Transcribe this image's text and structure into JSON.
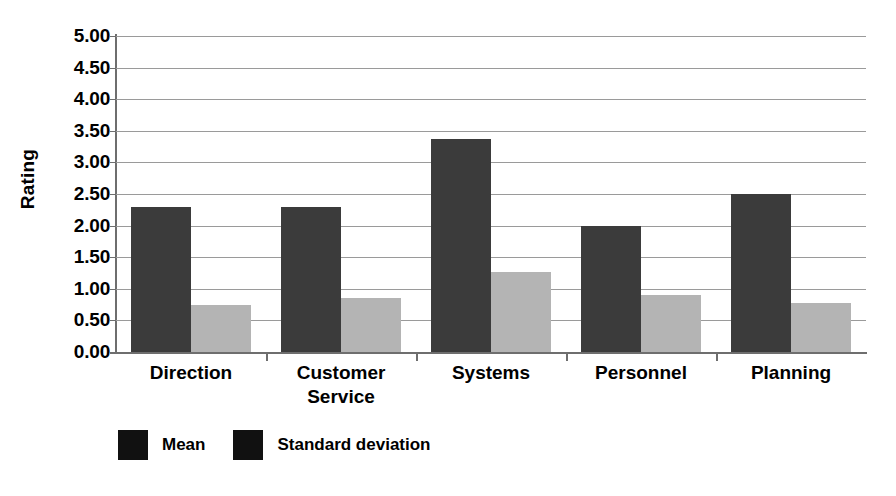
{
  "chart_data": {
    "type": "bar",
    "title": "",
    "xlabel": "",
    "ylabel": "Rating",
    "ylim": [
      0,
      5
    ],
    "ytick_step": 0.5,
    "grid": true,
    "legend_position": "bottom-left",
    "categories": [
      "Direction",
      "Customer Service",
      "Systems",
      "Personnel",
      "Planning"
    ],
    "category_lines": [
      [
        "Direction"
      ],
      [
        "Customer",
        "Service"
      ],
      [
        "Systems"
      ],
      [
        "Personnel"
      ],
      [
        "Planning"
      ]
    ],
    "series": [
      {
        "name": "Mean",
        "color": "#3b3b3b",
        "values": [
          2.3,
          2.3,
          3.37,
          2.0,
          2.5
        ]
      },
      {
        "name": "Standard deviation",
        "color": "#b4b4b4",
        "values": [
          0.74,
          0.85,
          1.27,
          0.9,
          0.77
        ]
      }
    ],
    "ytick_labels": [
      "5.00",
      "4.50",
      "4.00",
      "3.50",
      "3.00",
      "2.50",
      "2.00",
      "1.50",
      "1.00",
      "0.50",
      "0.00"
    ],
    "ytick_values": [
      5.0,
      4.5,
      4.0,
      3.5,
      3.0,
      2.5,
      2.0,
      1.5,
      1.0,
      0.5,
      0.0
    ]
  },
  "legend": {
    "entries": [
      {
        "label": "Mean",
        "swatch_color": "#111111"
      },
      {
        "label": "Standard deviation",
        "swatch_color": "#111111"
      }
    ]
  },
  "colors": {
    "mean_bar": "#3b3b3b",
    "stddev_bar": "#b4b4b4",
    "gridline": "#9a9a9a",
    "axis": "#6e6e6e",
    "text": "#000000",
    "background": "#ffffff"
  }
}
